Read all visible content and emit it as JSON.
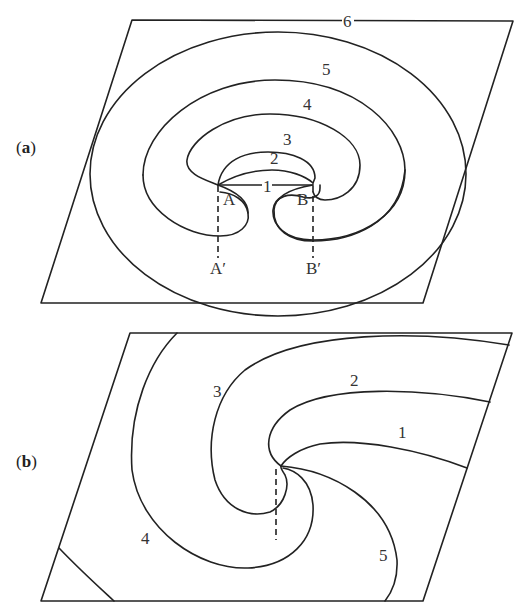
{
  "figure": {
    "panel_a": {
      "label_open": "(",
      "label_letter": "a",
      "label_close": ")",
      "contours": [
        "1",
        "2",
        "3",
        "4",
        "5",
        "6"
      ],
      "points": {
        "A": "A",
        "B": "B",
        "A_prime": "A′",
        "B_prime": "B′"
      }
    },
    "panel_b": {
      "label_open": "(",
      "label_letter": "b",
      "label_close": ")",
      "contours": [
        "1",
        "2",
        "3",
        "4",
        "5"
      ]
    }
  }
}
